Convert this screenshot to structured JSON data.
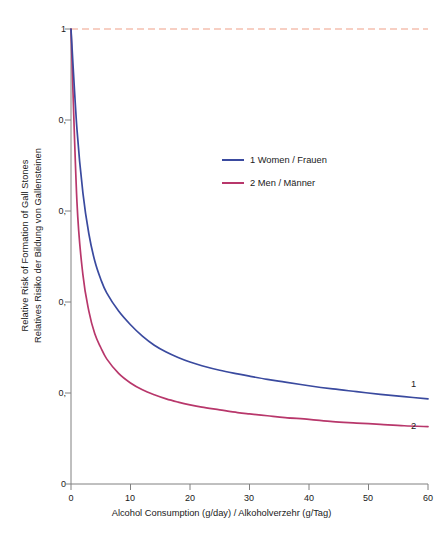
{
  "chart_data": {
    "type": "line",
    "title": "",
    "xlabel": "Alcohol Consumption (g/day) / Alkoholverzehr (g/Tag)",
    "ylabel_line1": "Relative Risk of Formation of Gall Stones",
    "ylabel_line2": "Relatives Risiko der Bildung von Gallensteinen",
    "xlim": [
      0,
      60
    ],
    "ylim": [
      0,
      1
    ],
    "xticks": [
      "0",
      "10",
      "20",
      "30",
      "40",
      "50",
      "60"
    ],
    "xtick_values": [
      0,
      10,
      20,
      30,
      40,
      50,
      60
    ],
    "yticks": [
      "0",
      "0,",
      "0,",
      "0,",
      "0,",
      "1"
    ],
    "ytick_values": [
      0,
      0.2,
      0.4,
      0.6,
      0.8,
      1
    ],
    "grid": false,
    "legend_position": "center",
    "reference_line": {
      "name": "baseline-risk",
      "value": 1,
      "style": "dashed",
      "color": "#f0a088"
    },
    "x": [
      0,
      1,
      2,
      3,
      4,
      5,
      6,
      8,
      10,
      12,
      14,
      16,
      18,
      20,
      22,
      25,
      28,
      30,
      33,
      36,
      40,
      44,
      48,
      52,
      56,
      60
    ],
    "series": [
      {
        "name": "1 Women / Frauen",
        "short": "1",
        "color": "#3a4a9f",
        "values": [
          1.0,
          0.78,
          0.64,
          0.55,
          0.49,
          0.45,
          0.42,
          0.38,
          0.35,
          0.325,
          0.305,
          0.29,
          0.278,
          0.268,
          0.26,
          0.25,
          0.242,
          0.237,
          0.23,
          0.224,
          0.216,
          0.209,
          0.203,
          0.197,
          0.192,
          0.187
        ]
      },
      {
        "name": "2 Men / Männer",
        "short": "2",
        "color": "#b8376b",
        "values": [
          1.0,
          0.62,
          0.46,
          0.38,
          0.33,
          0.3,
          0.275,
          0.243,
          0.222,
          0.207,
          0.196,
          0.187,
          0.18,
          0.174,
          0.169,
          0.163,
          0.157,
          0.154,
          0.15,
          0.146,
          0.142,
          0.137,
          0.134,
          0.131,
          0.128,
          0.126
        ]
      }
    ],
    "annotations": [
      {
        "text": "1",
        "series": "1 Women / Frauen"
      },
      {
        "text": "2",
        "series": "2 Men / Männer"
      }
    ]
  },
  "legend": {
    "items": [
      {
        "label": "1 Women / Frauen",
        "color": "#3a4a9f"
      },
      {
        "label": "2 Men / Männer",
        "color": "#b8376b"
      }
    ]
  },
  "axes": {
    "y_title_line1": "Relative Risk of Formation of Gall Stones",
    "y_title_line2": "Relatives Risiko der Bildung von Gallensteinen",
    "x_title": "Alcohol Consumption (g/day) / Alkoholverzehr (g/Tag)",
    "ytick_labels": [
      "1",
      "0,",
      "0,",
      "0,",
      "0,",
      "0"
    ],
    "xtick_labels": [
      "0",
      "10",
      "20",
      "30",
      "40",
      "50",
      "60"
    ]
  },
  "annotations": {
    "women_tag": "1",
    "men_tag": "2"
  }
}
